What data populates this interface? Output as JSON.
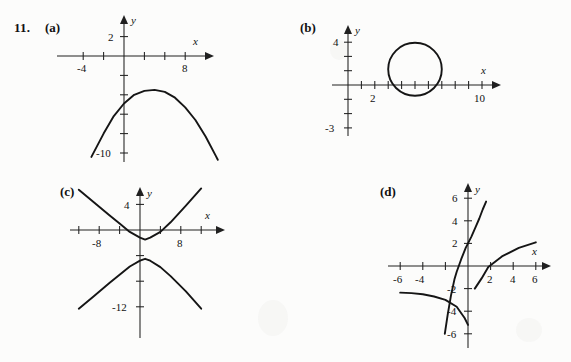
{
  "exercise": {
    "number": "11.",
    "panels": [
      {
        "key": "a",
        "label": "(a)"
      },
      {
        "key": "b",
        "label": "(b)"
      },
      {
        "key": "c",
        "label": "(c)"
      },
      {
        "key": "d",
        "label": "(d)"
      }
    ]
  },
  "axis_names": {
    "x": "x",
    "y": "y"
  },
  "chart_data": [
    {
      "type": "line",
      "panel": "a",
      "title": "(a)",
      "xlabel": "x",
      "ylabel": "y",
      "xlim": [
        -5,
        10
      ],
      "ylim": [
        -11,
        3
      ],
      "grid": false,
      "legend": "none",
      "x_ticks": [
        -4,
        -2,
        0,
        2,
        4,
        6,
        8
      ],
      "x_tick_labels": [
        "-4",
        "",
        "",
        "",
        "",
        "",
        "8"
      ],
      "y_ticks": [
        2,
        0,
        -2,
        -4,
        -6,
        -8,
        -10
      ],
      "y_tick_labels": [
        "2",
        "",
        "",
        "",
        "",
        "",
        "-10"
      ],
      "series": [
        {
          "name": "downward parabola",
          "description": "concave-down parabola with vertex near (3, -3.5), crossing y = -10 near x = -3 and x = 9",
          "x": [
            -3.2,
            -2.0,
            -1.0,
            0.0,
            1.0,
            2.0,
            3.0,
            4.0,
            5.0,
            6.0,
            7.0,
            8.0,
            9.0,
            9.2
          ],
          "y": [
            -10.4,
            -8.0,
            -6.2,
            -4.9,
            -4.0,
            -3.6,
            -3.5,
            -3.7,
            -4.3,
            -5.3,
            -6.6,
            -8.3,
            -10.3,
            -10.7
          ]
        }
      ]
    },
    {
      "type": "line",
      "panel": "b",
      "title": "(b)",
      "xlabel": "x",
      "ylabel": "y",
      "xlim": [
        -1,
        11
      ],
      "ylim": [
        -3.5,
        4.5
      ],
      "grid": false,
      "legend": "none",
      "x_ticks": [
        1,
        2,
        3,
        4,
        5,
        6,
        7,
        8,
        9,
        10
      ],
      "x_tick_labels": [
        "",
        "2",
        "",
        "",
        "",
        "",
        "",
        "",
        "",
        "10"
      ],
      "y_ticks": [
        4,
        3,
        2,
        1,
        0,
        -1,
        -2,
        -3
      ],
      "y_tick_labels": [
        "4",
        "",
        "",
        "",
        "",
        "",
        "",
        "-3"
      ],
      "series": [
        {
          "name": "circle",
          "description": "closed circular curve centered near (5, 1.1) with radius about 2, tangent to / just crossing the x-axis",
          "center_x": 5.0,
          "center_y": 1.1,
          "radius_x": 2.0,
          "radius_y": 1.85
        }
      ]
    },
    {
      "type": "line",
      "panel": "c",
      "title": "(c)",
      "xlabel": "x",
      "ylabel": "y",
      "xlim": [
        -14,
        14
      ],
      "ylim": [
        -14,
        8
      ],
      "grid": false,
      "legend": "none",
      "x_ticks": [
        -12,
        -8,
        -4,
        0,
        4,
        8,
        12
      ],
      "x_tick_labels": [
        "",
        "-8",
        "",
        "",
        "",
        "8",
        ""
      ],
      "y_ticks": [
        4,
        0,
        -4,
        -8,
        -12
      ],
      "y_tick_labels": [
        "4",
        "",
        "",
        "",
        "-12"
      ],
      "series": [
        {
          "name": "hyperbola upper branch",
          "description": "opens upward, vertex near (1, -1.5), asymptotic straight arms rising to the upper left and upper right",
          "x": [
            -12.0,
            -9.0,
            -6.0,
            -4.0,
            -2.0,
            0.0,
            1.0,
            2.0,
            4.0,
            6.0,
            9.0,
            12.0
          ],
          "y": [
            6.3,
            4.3,
            2.3,
            1.0,
            -0.3,
            -1.2,
            -1.5,
            -1.2,
            -0.3,
            1.2,
            3.8,
            6.5
          ]
        },
        {
          "name": "hyperbola lower branch",
          "description": "opens downward, vertex near (1, -4.5), arms descending to the lower left and lower right",
          "x": [
            -12.0,
            -9.0,
            -6.0,
            -4.0,
            -2.0,
            0.0,
            1.0,
            2.0,
            4.0,
            6.0,
            9.0,
            12.0
          ],
          "y": [
            -12.3,
            -10.3,
            -8.3,
            -7.0,
            -5.7,
            -4.8,
            -4.5,
            -4.8,
            -5.8,
            -7.2,
            -9.6,
            -12.3
          ]
        }
      ]
    },
    {
      "type": "line",
      "panel": "d",
      "title": "(d)",
      "xlabel": "x",
      "ylabel": "y",
      "xlim": [
        -6.8,
        6.8
      ],
      "ylim": [
        -6.8,
        6.8
      ],
      "grid": false,
      "legend": "none",
      "x_ticks": [
        -6,
        -4,
        -2,
        0,
        2,
        4,
        6
      ],
      "x_tick_labels": [
        "-6",
        "-4",
        "",
        "",
        "2",
        "4",
        "6"
      ],
      "y_ticks": [
        6,
        4,
        2,
        0,
        -2,
        -4,
        -6
      ],
      "y_tick_labels": [
        "6",
        "4",
        "2",
        "",
        "-2",
        "-4",
        "-6"
      ],
      "series": [
        {
          "name": "steep increasing curve",
          "description": "steep S-shaped increasing curve through (-1, 0) and (0, 2), running from about (-2, -6) up to (1.6, 5.7)",
          "x": [
            -2.05,
            -1.8,
            -1.5,
            -1.2,
            -1.0,
            -0.6,
            -0.2,
            0.0,
            0.3,
            0.7,
            1.0,
            1.3,
            1.6
          ],
          "y": [
            -6.0,
            -4.3,
            -2.6,
            -1.2,
            -0.5,
            0.6,
            1.6,
            2.0,
            2.6,
            3.5,
            4.2,
            5.0,
            5.7
          ]
        },
        {
          "name": "shallow increasing curve",
          "description": "shallow increasing curve through (0, -2) and (1.8, 0), running from about (-6, -2.3) up to (6, 2.1)",
          "x": [
            -6.0,
            -5.0,
            -4.0,
            -3.0,
            -2.0,
            -1.0,
            -0.3,
            0.0,
            0.6,
            1.2,
            1.8,
            3.0,
            4.5,
            6.0
          ],
          "y": [
            -2.35,
            -2.4,
            -2.5,
            -2.7,
            -3.0,
            -3.6,
            -4.6,
            -5.2,
            -2.0,
            -1.1,
            -0.1,
            0.85,
            1.6,
            2.1
          ]
        }
      ]
    }
  ]
}
